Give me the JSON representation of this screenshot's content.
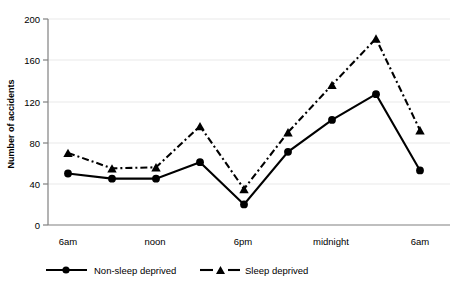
{
  "chart_data": {
    "type": "line",
    "title": "",
    "xlabel": "",
    "ylabel": "Number of accidents",
    "ylim": [
      0,
      200
    ],
    "yticks": [
      0,
      40,
      80,
      120,
      160,
      200
    ],
    "grid": true,
    "legend_position": "bottom",
    "x_tick_labels": [
      "6am",
      "noon",
      "6pm",
      "midnight",
      "6am"
    ],
    "x_tick_indices": [
      0,
      2,
      4,
      6,
      8
    ],
    "x": [
      "6am",
      "9am",
      "noon",
      "3pm",
      "6pm",
      "9pm",
      "midnight",
      "3am",
      "6am"
    ],
    "series": [
      {
        "name": "Non-sleep deprived",
        "marker": "circle",
        "line_style": "solid",
        "color": "#000000",
        "values": [
          50,
          45,
          45,
          61,
          20,
          71,
          102,
          127,
          53
        ]
      },
      {
        "name": "Sleep deprived",
        "marker": "triangle",
        "line_style": "dash-dot",
        "color": "#000000",
        "values": [
          70,
          55,
          56,
          96,
          35,
          90,
          136,
          181,
          92
        ]
      }
    ]
  },
  "axes": {
    "y_title": "Number of accidents",
    "y_tick_labels": [
      "0",
      "40",
      "80",
      "120",
      "160",
      "200"
    ],
    "x_tick_labels": [
      "6am",
      "noon",
      "6pm",
      "midnight",
      "6am"
    ]
  },
  "legend": {
    "entries": [
      {
        "label": "Non-sleep deprived",
        "marker": "circle-marker",
        "line": "solid-line"
      },
      {
        "label": "Sleep deprived",
        "marker": "triangle-marker",
        "line": "dashed-line"
      }
    ]
  },
  "colors": {
    "ink": "#000000",
    "grid": "#e9e9e9",
    "axis": "#808080",
    "background": "#ffffff"
  }
}
